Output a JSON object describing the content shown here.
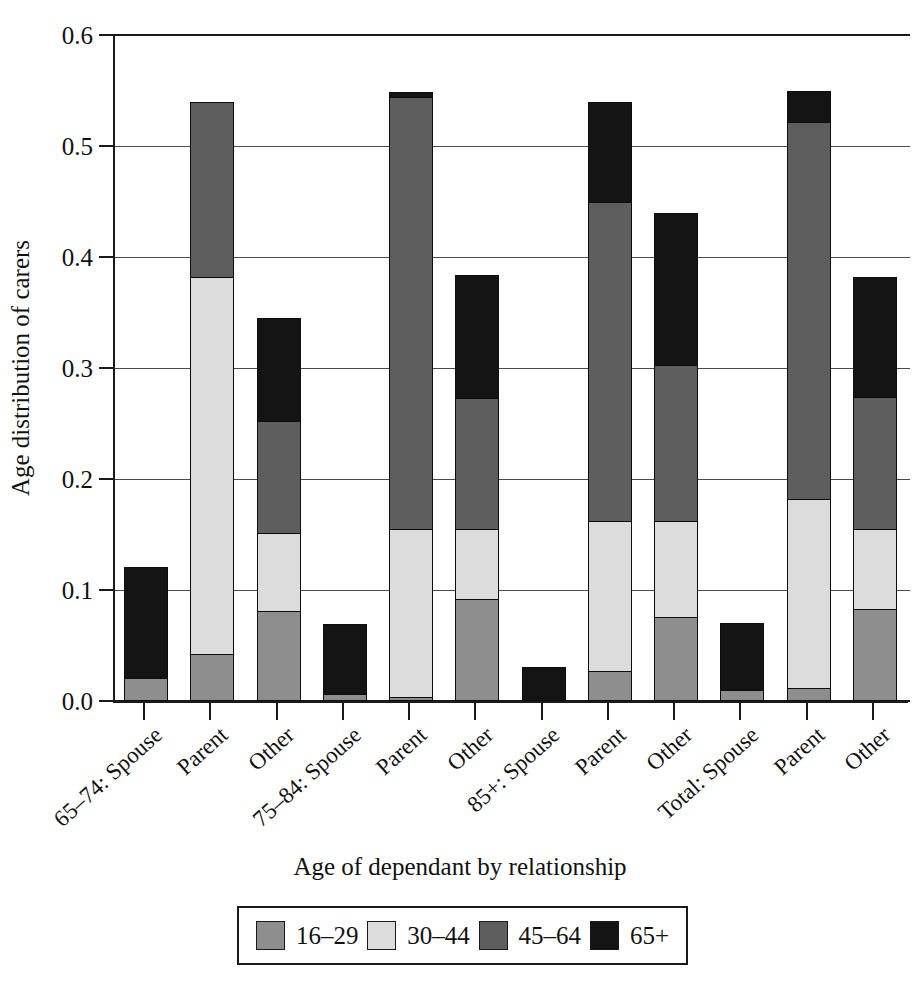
{
  "figure": {
    "top_caption_fragment": "",
    "ylabel": "Age distribution of carers",
    "xlabel": "Age of dependant by relationship"
  },
  "legend": {
    "position": "below-axis",
    "items": [
      {
        "label": "16–29",
        "color": "#8e8e8e"
      },
      {
        "label": "30–44",
        "color": "#dcdcdc"
      },
      {
        "label": "45–64",
        "color": "#5e5e5e"
      },
      {
        "label": "65+",
        "color": "#141414"
      }
    ]
  },
  "yaxis": {
    "ticks": [
      "0.0",
      "0.1",
      "0.2",
      "0.3",
      "0.4",
      "0.5",
      "0.6"
    ],
    "min": 0.0,
    "max": 0.6,
    "step": 0.1
  },
  "chart_data": {
    "type": "bar",
    "subtype": "stacked-bar",
    "title": "",
    "xlabel": "Age of dependant by relationship",
    "ylabel": "Age distribution of carers",
    "ylim": [
      0.0,
      0.6
    ],
    "ytick_step": 0.1,
    "grid": "horizontal",
    "legend_position": "bottom",
    "categories": [
      "65–74: Spouse",
      "Parent",
      "Other",
      "75–84: Spouse",
      "Parent",
      "Other",
      "85+: Spouse",
      "Parent",
      "Other",
      "Total: Spouse",
      "Parent",
      "Other"
    ],
    "series": [
      {
        "name": "16–29",
        "color": "#8e8e8e",
        "values": [
          0.021,
          0.042,
          0.081,
          0.006,
          0.004,
          0.092,
          0.0,
          0.027,
          0.076,
          0.01,
          0.012,
          0.083
        ]
      },
      {
        "name": "30–44",
        "color": "#dcdcdc",
        "values": [
          0.0,
          0.34,
          0.07,
          0.0,
          0.151,
          0.063,
          0.0,
          0.135,
          0.086,
          0.0,
          0.17,
          0.072
        ]
      },
      {
        "name": "45–64",
        "color": "#5e5e5e",
        "values": [
          0.0,
          0.158,
          0.101,
          0.0,
          0.389,
          0.118,
          0.0,
          0.288,
          0.141,
          0.0,
          0.34,
          0.119
        ]
      },
      {
        "name": "65+",
        "color": "#141414",
        "values": [
          0.1,
          0.0,
          0.093,
          0.063,
          0.005,
          0.111,
          0.031,
          0.09,
          0.137,
          0.06,
          0.028,
          0.108
        ]
      }
    ],
    "totals": [
      0.121,
      0.54,
      0.345,
      0.069,
      0.549,
      0.384,
      0.031,
      0.54,
      0.44,
      0.07,
      0.55,
      0.382
    ]
  }
}
